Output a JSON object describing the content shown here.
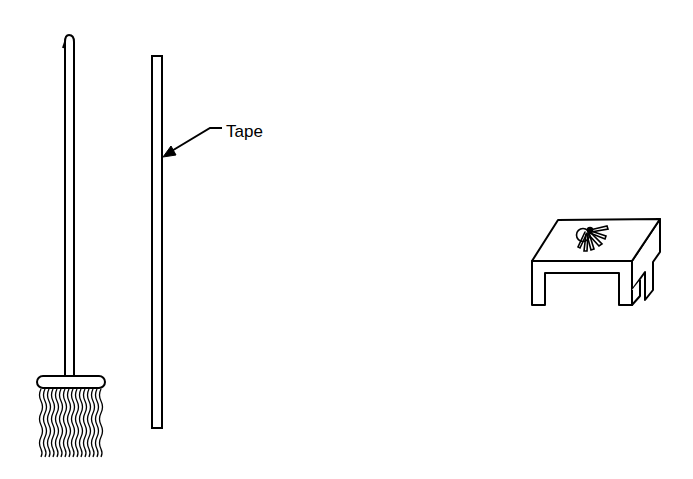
{
  "diagram": {
    "objects": [
      {
        "id": "mop",
        "description": "mop with long handle and stringy head"
      },
      {
        "id": "stick",
        "description": "long straight stick"
      },
      {
        "id": "table",
        "description": "small table with keys on top"
      },
      {
        "id": "keys",
        "description": "bunch of keys on a ring"
      }
    ],
    "labels": {
      "tape": "Tape"
    },
    "colors": {
      "ink": "#000000",
      "background": "#ffffff"
    }
  }
}
